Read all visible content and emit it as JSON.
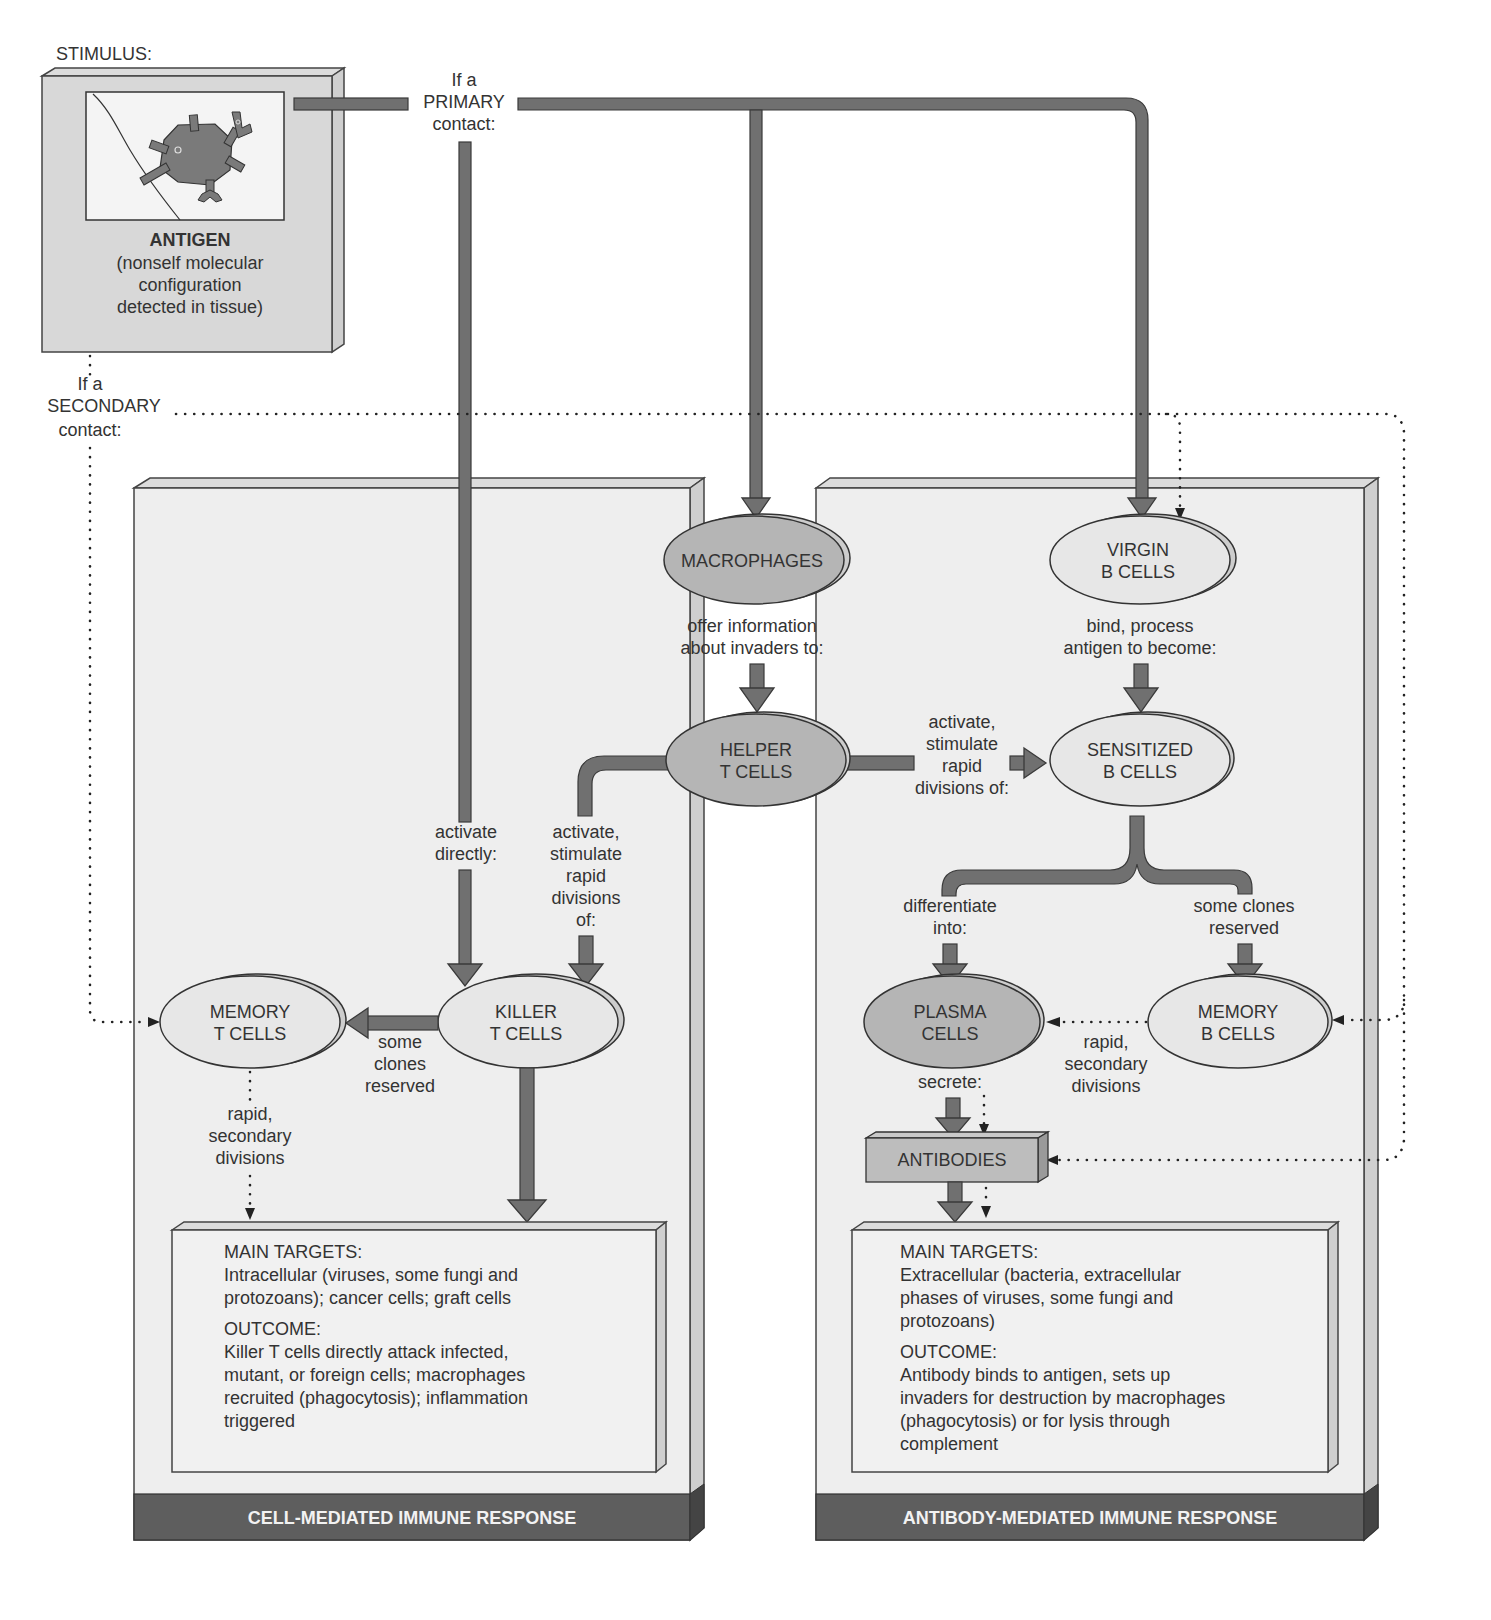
{
  "stimulus": {
    "label": "STIMULUS:",
    "title": "ANTIGEN",
    "description_lines": [
      "(nonself molecular",
      "configuration",
      "detected in tissue)"
    ]
  },
  "contacts": {
    "primary": [
      "If a",
      "PRIMARY",
      "contact:"
    ],
    "secondary": [
      "If a",
      "SECONDARY",
      "contact:"
    ]
  },
  "nodes": {
    "macrophages": [
      "MACROPHAGES"
    ],
    "virgin_b": [
      "VIRGIN",
      "B CELLS"
    ],
    "helper_t": [
      "HELPER",
      "T CELLS"
    ],
    "sensitized_b": [
      "SENSITIZED",
      "B CELLS"
    ],
    "killer_t": [
      "KILLER",
      "T CELLS"
    ],
    "memory_t": [
      "MEMORY",
      "T CELLS"
    ],
    "plasma": [
      "PLASMA",
      "CELLS"
    ],
    "memory_b": [
      "MEMORY",
      "B CELLS"
    ],
    "antibodies": "ANTIBODIES"
  },
  "edge_labels": {
    "macro_to_helper": [
      "offer information",
      "about invaders to:"
    ],
    "virgin_to_sensitized": [
      "bind, process",
      "antigen to become:"
    ],
    "helper_to_sensitized": [
      "activate,",
      "stimulate",
      "rapid",
      "divisions of:"
    ],
    "activate_directly": [
      "activate",
      "directly:"
    ],
    "helper_to_killer": [
      "activate,",
      "stimulate",
      "rapid",
      "divisions",
      "of:"
    ],
    "killer_to_memory": [
      "some",
      "clones",
      "reserved"
    ],
    "memory_t_secondary": [
      "rapid,",
      "secondary",
      "divisions"
    ],
    "differentiate": [
      "differentiate",
      "into:"
    ],
    "clones_reserved_b": [
      "some clones",
      "reserved"
    ],
    "memory_b_secondary": [
      "rapid,",
      "secondary",
      "divisions"
    ],
    "secrete": [
      "secrete:"
    ]
  },
  "panels": {
    "cell_mediated": {
      "title": "CELL-MEDIATED IMMUNE RESPONSE",
      "targets_heading": "MAIN TARGETS:",
      "targets_lines": [
        "Intracellular (viruses, some fungi and",
        "protozoans); cancer cells; graft cells"
      ],
      "outcome_heading": "OUTCOME:",
      "outcome_lines": [
        "Killer T cells directly attack infected,",
        "mutant, or foreign cells; macrophages",
        "recruited (phagocytosis); inflammation",
        "triggered"
      ]
    },
    "antibody_mediated": {
      "title": "ANTIBODY-MEDIATED IMMUNE RESPONSE",
      "targets_heading": "MAIN TARGETS:",
      "targets_lines": [
        "Extracellular (bacteria, extracellular",
        "phases of viruses, some fungi and",
        "protozoans)"
      ],
      "outcome_heading": "OUTCOME:",
      "outcome_lines": [
        "Antibody binds to antigen, sets up",
        "invaders for destruction by macrophages",
        "(phagocytosis) or for lysis through",
        "complement"
      ]
    }
  },
  "colors": {
    "arrow": "#707070",
    "panel": "#eeeeee",
    "footer": "#5e5e5e",
    "ellipse_dark": "#b5b5b5",
    "ellipse_light": "#e7e7e7"
  }
}
